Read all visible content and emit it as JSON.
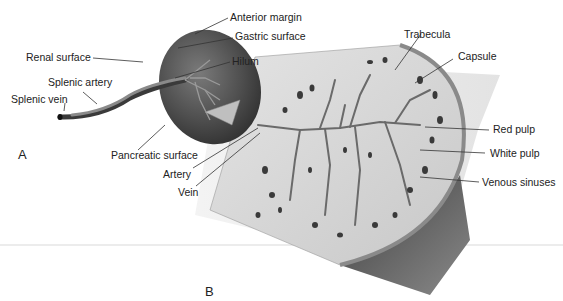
{
  "figure": {
    "panels": [
      {
        "id": "A",
        "label": "A"
      },
      {
        "id": "B",
        "label": "B"
      }
    ],
    "panel_a_labels": {
      "anterior_margin": "Anterior margin",
      "gastric_surface": "Gastric surface",
      "renal_surface": "Renal surface",
      "hilum": "Hilum",
      "splenic_artery": "Splenic artery",
      "splenic_vein": "Splenic vein",
      "pancreatic_surface": "Pancreatic surface"
    },
    "panel_b_labels": {
      "trabecula": "Trabecula",
      "capsule": "Capsule",
      "red_pulp": "Red pulp",
      "white_pulp": "White pulp",
      "venous_sinuses": "Venous sinuses",
      "artery": "Artery",
      "vein": "Vein"
    },
    "colors": {
      "organ_dark": "#4a4a4a",
      "organ_mid": "#6e6e6e",
      "tissue_light": "#d9d9d9",
      "leader_line": "#333333",
      "divider": "#e6e6e6"
    }
  }
}
